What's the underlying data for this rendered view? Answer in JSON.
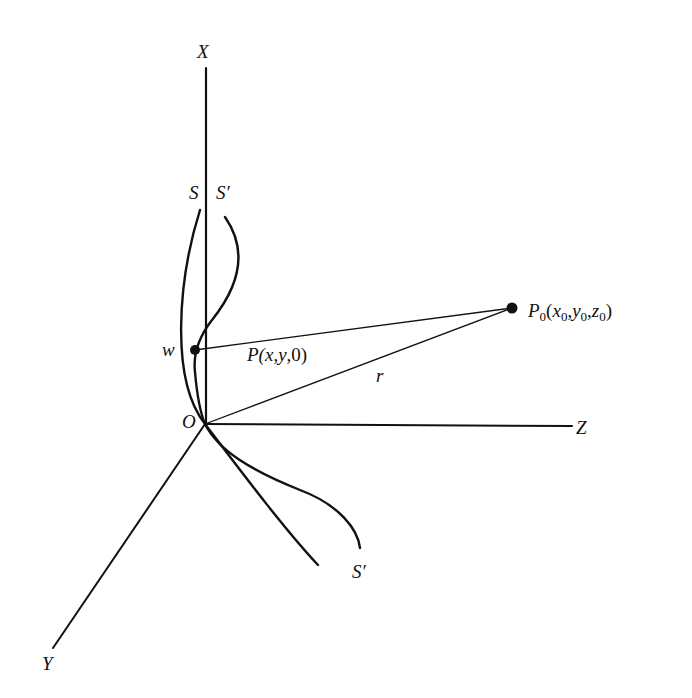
{
  "diagram": {
    "type": "3d-coordinate-geometry",
    "colors": {
      "stroke": "#111111",
      "background": "#ffffff"
    },
    "axes": {
      "x": {
        "label": "X"
      },
      "y": {
        "label": "Y"
      },
      "z": {
        "label": "Z"
      },
      "origin": {
        "label": "O"
      }
    },
    "curves": [
      {
        "id": "S",
        "label": "S"
      },
      {
        "id": "S-prime",
        "label": "S′",
        "label_bottom": "S′"
      }
    ],
    "points": {
      "w": {
        "label": "w"
      },
      "P": {
        "label_main": "P(x",
        "label_y": "y",
        "label_rest": ",0)",
        "full": "P(x,y,0)"
      },
      "P0": {
        "label_main": "P",
        "sub": "0",
        "full": "P0(x0,y0,z0)"
      }
    },
    "segments": {
      "r": {
        "label": "r"
      }
    }
  }
}
